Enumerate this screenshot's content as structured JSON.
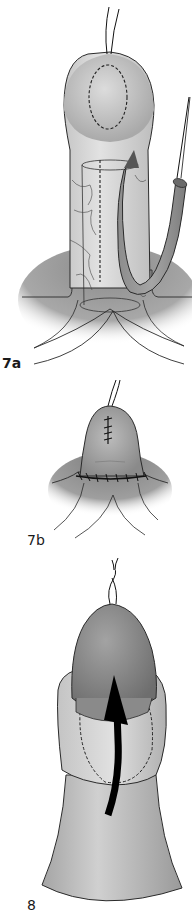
{
  "figures": [
    {
      "id": "7a",
      "label": "7a",
      "description": "Shaft with dorsal tubularized flap raised and held by traction suture; dashed incision outline on glans"
    },
    {
      "id": "7b",
      "label": "7b",
      "description": "Glans closure with interrupted sutures and circumferential suture line at base"
    },
    {
      "id": "8",
      "label": "8",
      "description": "Glans with skin rolled back; curved arrow indicating flap rotation direction; dashed outline"
    }
  ],
  "colors": {
    "skin_light": "#d4d4d4",
    "skin_mid": "#b5b5b5",
    "skin_dark": "#8e8e8e",
    "shadow_base": "#9a9a9a",
    "outline": "#2a2a2a",
    "arrow": "#000000",
    "background": "#ffffff"
  }
}
